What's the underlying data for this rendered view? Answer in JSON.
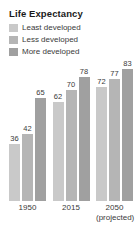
{
  "chart_data": {
    "type": "bar",
    "title": "Life Expectancy",
    "xlabel": "",
    "ylabel": "",
    "ylim": [
      0,
      90
    ],
    "grid": false,
    "legend_position": "top-left",
    "categories": [
      "1950",
      "2015",
      "2050"
    ],
    "category_sublabels": [
      "",
      "",
      "(projected)"
    ],
    "series": [
      {
        "name": "Least developed",
        "color": "#c9c9c9",
        "values": [
          36,
          62,
          72
        ]
      },
      {
        "name": "Less developed",
        "color": "#b5b5b5",
        "values": [
          42,
          70,
          77
        ]
      },
      {
        "name": "More developed",
        "color": "#a0a0a0",
        "values": [
          65,
          78,
          83
        ]
      }
    ]
  },
  "chart": {
    "title": "Life Expectancy",
    "legend": [
      {
        "label": "Least developed",
        "color": "#c9c9c9"
      },
      {
        "label": "Less developed",
        "color": "#b5b5b5"
      },
      {
        "label": "More developed",
        "color": "#a0a0a0"
      }
    ],
    "groups": [
      {
        "label": "1950",
        "sublabel": "",
        "bars": [
          {
            "value": "36",
            "series": "Least developed"
          },
          {
            "value": "42",
            "series": "Less developed"
          },
          {
            "value": "65",
            "series": "More developed"
          }
        ]
      },
      {
        "label": "2015",
        "sublabel": "",
        "bars": [
          {
            "value": "62",
            "series": "Least developed"
          },
          {
            "value": "70",
            "series": "Less developed"
          },
          {
            "value": "78",
            "series": "More developed"
          }
        ]
      },
      {
        "label": "2050",
        "sublabel": "(projected)",
        "bars": [
          {
            "value": "72",
            "series": "Least developed"
          },
          {
            "value": "77",
            "series": "Less developed"
          },
          {
            "value": "83",
            "series": "More developed"
          }
        ]
      }
    ]
  }
}
